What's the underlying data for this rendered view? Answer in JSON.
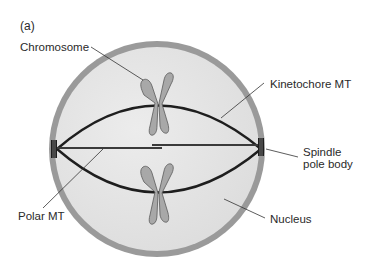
{
  "figure": {
    "panel_label": "(a)"
  },
  "labels": {
    "chromosome": "Chromosome",
    "kinetochore_mt": "Kinetochore MT",
    "spindle_pole_body_line1": "Spindle",
    "spindle_pole_body_line2": "pole body",
    "polar_mt": "Polar MT",
    "nucleus": "Nucleus"
  },
  "colors": {
    "nuclear_envelope": "#9a9a9a",
    "nucleoplasm": "#e4e4e4",
    "microtubule": "#1e1e1e",
    "chromosome_fill": "#a8a8a8",
    "chromosome_outline": "#5a5a5a",
    "leader_line": "#333333",
    "text": "#2a2a2a"
  }
}
